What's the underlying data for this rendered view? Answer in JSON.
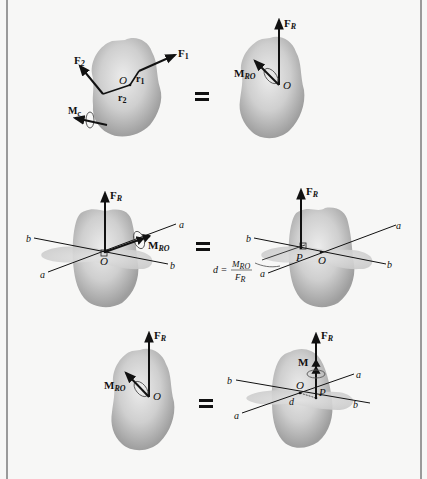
{
  "figure": {
    "colors": {
      "background": "#f7f7f6",
      "body_fill": "#b8b8b8",
      "body_highlight": "#e6e6e6",
      "plane_fill": "#d4d4d4",
      "vector": "#111111",
      "border": "#9a9a9a"
    },
    "equals_sign": "=",
    "rows": [
      {
        "left": {
          "labels": {
            "F2": "F",
            "F2_sub": "2",
            "F1": "F",
            "F1_sub": "1",
            "O": "O",
            "r1": "r",
            "r1_sub": "1",
            "r2": "r",
            "r2_sub": "2",
            "Mc": "M",
            "Mc_sub": "c"
          }
        },
        "right": {
          "labels": {
            "FR": "F",
            "FR_sub": "R",
            "MRO": "M",
            "MRO_sub": "RO",
            "O": "O"
          }
        }
      },
      {
        "left": {
          "labels": {
            "FR": "F",
            "FR_sub": "R",
            "MRO": "M",
            "MRO_sub": "RO",
            "O": "O",
            "a_top": "a",
            "a_bottom": "a",
            "b_left": "b",
            "b_right": "b"
          }
        },
        "right": {
          "labels": {
            "FR": "F",
            "FR_sub": "R",
            "P": "P",
            "O": "O",
            "a_top": "a",
            "a_bottom": "a",
            "b_left": "b",
            "b_right": "b",
            "d_eq": "d =",
            "d_num": "M",
            "d_num_sub": "RO",
            "d_den": "F",
            "d_den_sub": "R"
          }
        }
      },
      {
        "left": {
          "labels": {
            "FR": "F",
            "FR_sub": "R",
            "MRO": "M",
            "MRO_sub": "RO",
            "O": "O"
          }
        },
        "right": {
          "labels": {
            "FR": "F",
            "FR_sub": "R",
            "M": "M",
            "O": "O",
            "P": "P",
            "d": "d",
            "a_top": "a",
            "a_bottom": "a",
            "b_left": "b",
            "b_right": "b"
          }
        }
      }
    ]
  }
}
